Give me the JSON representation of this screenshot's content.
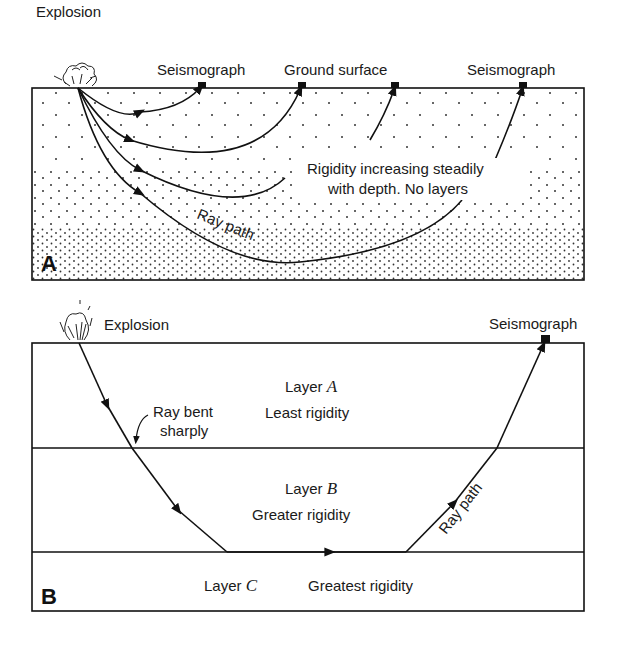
{
  "panel_a": {
    "letter": "A",
    "explosion_label": "Explosion",
    "seismograph_label_1": "Seismograph",
    "ground_surface_label": "Ground surface",
    "seismograph_label_2": "Seismograph",
    "note_line_1": "Rigidity increasing steadily",
    "note_line_2": "with depth. No layers",
    "ray_path_label": "Ray path"
  },
  "panel_b": {
    "letter": "B",
    "explosion_label": "Explosion",
    "seismograph_label": "Seismograph",
    "layer_a": {
      "name_prefix": "Layer ",
      "name_var": "A",
      "desc": "Least rigidity"
    },
    "layer_b": {
      "name_prefix": "Layer ",
      "name_var": "B",
      "desc": "Greater rigidity"
    },
    "layer_c": {
      "name_prefix": "Layer ",
      "name_var": "C",
      "desc": "Greatest rigidity"
    },
    "bend_note_line_1": "Ray bent",
    "bend_note_line_2": "sharply",
    "ray_path_label": "Ray path"
  }
}
